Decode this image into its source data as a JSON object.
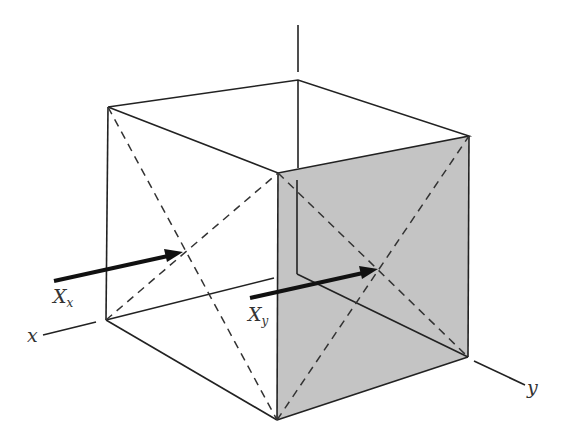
{
  "figure": {
    "type": "cube diagram",
    "colors": {
      "line": "#222222",
      "shaded_face": "#c4c4c4",
      "background": "#ffffff"
    },
    "labels": {
      "x_axis": "x",
      "y_axis": "y",
      "arrow_x": {
        "main": "X",
        "sub": "x"
      },
      "arrow_y": {
        "main": "X",
        "sub": "y"
      }
    }
  }
}
